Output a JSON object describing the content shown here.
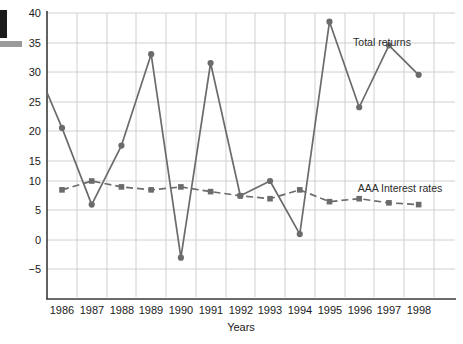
{
  "chart_data": {
    "type": "line",
    "title": "",
    "xlabel": "Years",
    "ylabel": "",
    "categories": [
      "1986",
      "1987",
      "1988",
      "1989",
      "1990",
      "1991",
      "1992",
      "1993",
      "1994",
      "1995",
      "1996",
      "1997",
      "1998"
    ],
    "ylim": [
      -5,
      40
    ],
    "ytick_labels": [
      "40",
      "35",
      "30",
      "25",
      "20",
      "15",
      "10",
      "5",
      "0",
      "−5"
    ],
    "ytick_values": [
      40,
      35,
      30,
      25,
      20,
      15,
      10,
      5,
      0,
      -5
    ],
    "grid": true,
    "legend_position": "inline-annotations",
    "series": [
      {
        "name": "Total returns",
        "style": "solid",
        "marker": "circle",
        "color": "#6b6b6b",
        "values": [
          19,
          6,
          16,
          31.5,
          -3,
          30,
          7.5,
          10,
          1,
          37,
          22.5,
          33,
          28
        ],
        "leading_edge_value": 25
      },
      {
        "name": "AAA Interest rates",
        "style": "dashed",
        "marker": "square",
        "color": "#6b6b6b",
        "values": [
          8.5,
          10,
          9,
          8.5,
          9,
          8.2,
          7.5,
          7,
          8.5,
          6.5,
          7,
          6.3,
          6
        ]
      }
    ],
    "annotations": [
      {
        "text": "Total returns",
        "x": 1996,
        "y": 35.5
      },
      {
        "text": "AAA Interest rates",
        "x": 1996.3,
        "y": 11.5
      }
    ]
  },
  "axis": {
    "xlabel": "Years"
  },
  "annotations": {
    "total_returns": "Total returns",
    "aaa_rates": "AAA Interest rates"
  }
}
